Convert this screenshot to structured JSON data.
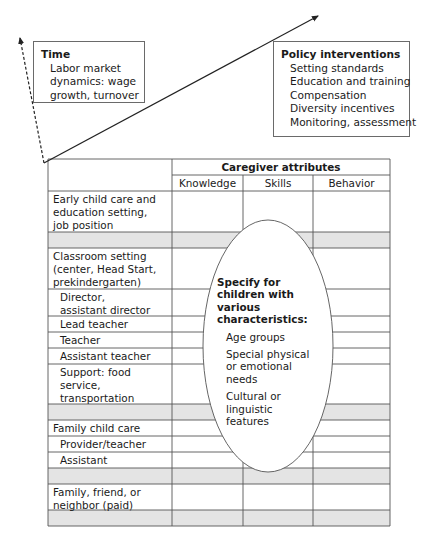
{
  "time_box": {
    "title": "Time",
    "lines": [
      "Labor market",
      "dynamics: wage",
      "growth, turnover"
    ]
  },
  "policy_box": {
    "title": "Policy interventions",
    "items": [
      "Setting standards",
      "Education and training",
      "Compensation",
      "Diversity incentives",
      "Monitoring, assessment"
    ]
  },
  "table": {
    "group_header": "Caregiver attributes",
    "columns": [
      "Knowledge",
      "Skills",
      "Behavior"
    ],
    "rows": [
      {
        "lines": [
          "Early child care and",
          "education setting,",
          "job position"
        ],
        "indent": false,
        "shaded": false
      },
      {
        "lines": [],
        "indent": false,
        "shaded": true
      },
      {
        "lines": [
          "Classroom setting",
          "(center, Head Start,",
          "prekindergarten)"
        ],
        "indent": false,
        "shaded": false
      },
      {
        "lines": [
          "Director,",
          "assistant director"
        ],
        "indent": true,
        "shaded": false
      },
      {
        "lines": [
          "Lead teacher"
        ],
        "indent": true,
        "shaded": false
      },
      {
        "lines": [
          "Teacher"
        ],
        "indent": true,
        "shaded": false
      },
      {
        "lines": [
          "Assistant teacher"
        ],
        "indent": true,
        "shaded": false
      },
      {
        "lines": [
          "Support: food",
          "service,",
          "transportation"
        ],
        "indent": true,
        "shaded": false
      },
      {
        "lines": [],
        "indent": false,
        "shaded": true
      },
      {
        "lines": [
          "Family child care"
        ],
        "indent": false,
        "shaded": false
      },
      {
        "lines": [
          "Provider/teacher"
        ],
        "indent": true,
        "shaded": false
      },
      {
        "lines": [
          "Assistant"
        ],
        "indent": true,
        "shaded": false
      },
      {
        "lines": [],
        "indent": false,
        "shaded": true
      },
      {
        "lines": [
          "Family, friend, or",
          "neighbor (paid)"
        ],
        "indent": false,
        "shaded": false
      },
      {
        "lines": [],
        "indent": false,
        "shaded": true
      }
    ]
  },
  "ellipse": {
    "title_lines": [
      "Specify for",
      "children with",
      "various",
      "characteristics:"
    ],
    "items": [
      [
        "Age groups"
      ],
      [
        "Special physical",
        "or emotional",
        "needs"
      ],
      [
        "Cultural or",
        "linguistic",
        "features"
      ]
    ]
  },
  "colors": {
    "line": "#555555",
    "shade": "#e4e4e4",
    "arrow": "#222222"
  }
}
